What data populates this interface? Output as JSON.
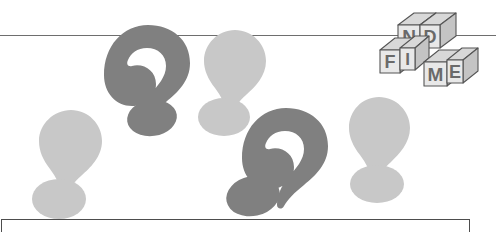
{
  "scene": {
    "title": "Find Me puzzle graphic",
    "background_color": "#ffffff",
    "width": 496,
    "height": 232
  },
  "colors": {
    "dark_gray": "#808080",
    "light_gray": "#c8c8c8",
    "block_face": "#e8e8e8",
    "block_side": "#c4c4c4",
    "block_top": "#d8d8d8",
    "outline": "#555555",
    "rule": "#6e6e6e",
    "box_border": "#4d4d4d"
  },
  "rules": {
    "top_rule_name": "horizontal-rule",
    "bottom_box_name": "bottom-border-box"
  },
  "blocks": {
    "word": "FIND ME",
    "cubes": [
      {
        "letter": "F",
        "name": "block-f"
      },
      {
        "letter": "I",
        "name": "block-i"
      },
      {
        "letter": "N",
        "name": "block-n"
      },
      {
        "letter": "D",
        "name": "block-d"
      },
      {
        "letter": "M",
        "name": "block-m"
      },
      {
        "letter": "E",
        "name": "block-e"
      }
    ]
  },
  "marks": [
    {
      "name": "question-mark-upper-left",
      "type": "question",
      "color": "dark_gray"
    },
    {
      "name": "question-mark-lower-center",
      "type": "question",
      "color": "dark_gray"
    },
    {
      "name": "exclamation-mark-left",
      "type": "exclamation",
      "color": "light_gray"
    },
    {
      "name": "exclamation-mark-center",
      "type": "exclamation",
      "color": "light_gray"
    },
    {
      "name": "exclamation-mark-right",
      "type": "exclamation",
      "color": "light_gray"
    }
  ]
}
